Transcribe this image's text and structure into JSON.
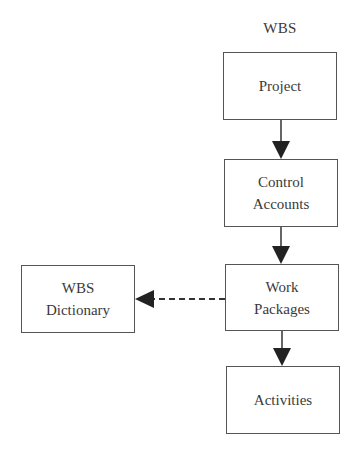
{
  "diagram": {
    "title": "WBS",
    "nodes": [
      {
        "id": "project",
        "lines": [
          "Project"
        ]
      },
      {
        "id": "control-accounts",
        "lines": [
          "Control",
          "Accounts"
        ]
      },
      {
        "id": "work-packages",
        "lines": [
          "Work",
          "Packages"
        ]
      },
      {
        "id": "activities",
        "lines": [
          "Activities"
        ]
      },
      {
        "id": "wbs-dictionary",
        "lines": [
          "WBS",
          "Dictionary"
        ]
      }
    ],
    "edges": [
      {
        "from": "project",
        "to": "control-accounts",
        "style": "solid"
      },
      {
        "from": "control-accounts",
        "to": "work-packages",
        "style": "solid"
      },
      {
        "from": "work-packages",
        "to": "activities",
        "style": "solid"
      },
      {
        "from": "work-packages",
        "to": "wbs-dictionary",
        "style": "dashed"
      }
    ],
    "colors": {
      "line": "#333333",
      "border": "#555555",
      "text": "#3a3a3a",
      "background": "#ffffff"
    }
  }
}
